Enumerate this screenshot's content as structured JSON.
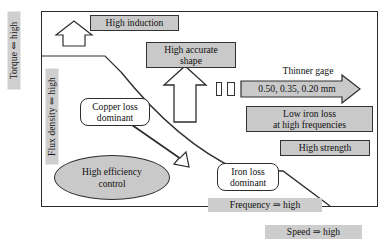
{
  "figure": {
    "type": "conceptual-diagram"
  },
  "axes": {
    "left_outer": {
      "label": "Torque ⇐ high",
      "orientation": "vertical"
    },
    "left_inner": {
      "label": "Flux density ⇐ high",
      "orientation": "vertical"
    },
    "bottom_inner": {
      "label": "Frequency ⇒ high",
      "orientation": "horizontal"
    },
    "bottom_outer": {
      "label": "Speed ⇒ high",
      "orientation": "horizontal"
    }
  },
  "boxes": {
    "high_induction": "High induction",
    "high_accurate_shape": "High accurate\nshape",
    "low_iron_loss": "Low iron loss\nat high frequencies",
    "high_strength": "High strength"
  },
  "regions": {
    "copper_loss": "Copper loss\ndominant",
    "iron_loss": "Iron loss\ndominant",
    "high_efficiency": "High efficiency\ncontrol"
  },
  "gage": {
    "caption": "Thinner gage",
    "values": "0.50, 0.35, 0.20 mm",
    "tick_count": 2
  },
  "arrows": {
    "up_left": "up-arrow-high-induction",
    "up_center": "up-arrow-high-accurate-shape",
    "diagonal": "double-headed-arrow-copper-iron-loss",
    "gage_arrow": "right-arrow-thinner-gage"
  },
  "colors": {
    "box_fill": "#c9c9c9",
    "strip_fill": "#cdcdcd",
    "axis_label_fill": "#cfcfcf",
    "outline": "#2e2e2e",
    "background": "#ffffff"
  }
}
